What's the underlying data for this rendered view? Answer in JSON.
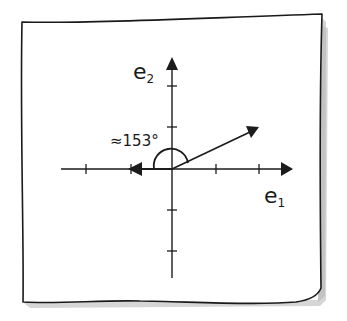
{
  "diagram": {
    "type": "2d-vector-angle-sketch",
    "style": "hand-drawn on paper note",
    "colors": {
      "ink": "#1a1a1a",
      "paper": "#ffffff",
      "shadow": "#bdbdbd"
    },
    "axes": {
      "x_label_base": "e",
      "x_label_sub": "1",
      "y_label_base": "e",
      "y_label_sub": "2",
      "x_ticks_count": 4,
      "y_ticks_count": 4
    },
    "angle_label": "≈153°",
    "vectors": [
      {
        "name": "vector-v",
        "direction": "up-right",
        "approx_components": [
          2,
          1
        ]
      },
      {
        "name": "vector-w",
        "direction": "left",
        "approx_components": [
          -1,
          0
        ]
      }
    ]
  }
}
